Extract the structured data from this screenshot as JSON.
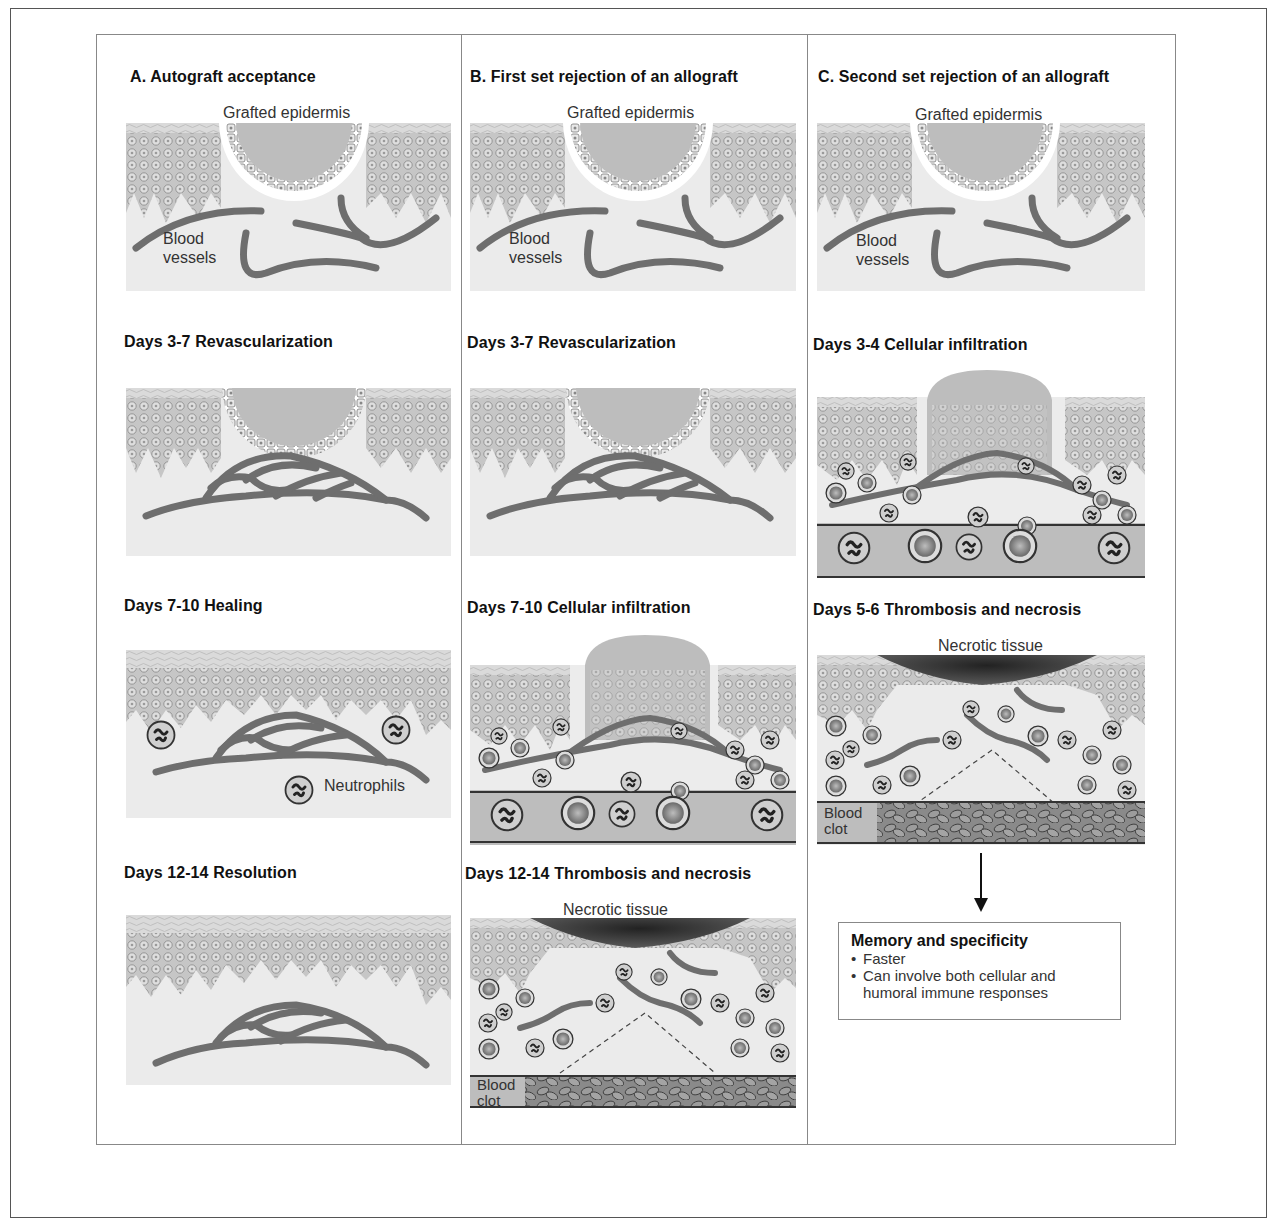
{
  "columns": [
    {
      "heading": "A.  Autograft acceptance",
      "stages": [
        {
          "heading": "",
          "type": "graft",
          "labels": {
            "graft": "Grafted epidermis",
            "vessels_1": "Blood",
            "vessels_2": "vessels"
          }
        },
        {
          "heading": "Days 3-7 Revascularization",
          "type": "revascularization"
        },
        {
          "heading": "Days 7-10 Healing",
          "type": "healing",
          "labels": {
            "neutrophils": "Neutrophils"
          }
        },
        {
          "heading": "Days 12-14 Resolution",
          "type": "resolution"
        }
      ]
    },
    {
      "heading": "B.  First set rejection of an allograft",
      "stages": [
        {
          "heading": "",
          "type": "graft",
          "labels": {
            "graft": "Grafted epidermis",
            "vessels_1": "Blood",
            "vessels_2": "vessels"
          }
        },
        {
          "heading": "Days 3-7 Revascularization",
          "type": "revascularization"
        },
        {
          "heading": "Days 7-10 Cellular infiltration",
          "type": "infiltration"
        },
        {
          "heading": "Days 12-14 Thrombosis and necrosis",
          "type": "necrosis",
          "labels": {
            "necrotic": "Necrotic tissue",
            "clot_1": "Blood",
            "clot_2": "clot"
          }
        }
      ]
    },
    {
      "heading": "C.  Second set rejection of an allograft",
      "stages": [
        {
          "heading": "",
          "type": "graft",
          "labels": {
            "graft": "Grafted epidermis",
            "vessels_1": "Blood",
            "vessels_2": "vessels"
          }
        },
        {
          "heading": "Days 3-4 Cellular infiltration",
          "type": "infiltration"
        },
        {
          "heading": "Days 5-6 Thrombosis and necrosis",
          "type": "necrosis",
          "labels": {
            "necrotic": "Necrotic tissue",
            "clot_1": "Blood",
            "clot_2": "clot"
          }
        }
      ]
    }
  ],
  "memory_box": {
    "title": "Memory and specificity",
    "bullet": "•",
    "items": [
      "Faster",
      "Can involve both cellular and",
      "humoral immune responses"
    ]
  },
  "colors": {
    "dermis": "#ebebeb",
    "epidermis": "#c9c9c9",
    "stratum": "#d8d8d8",
    "vessel": "#6e6e6e",
    "necrotic": "#3a3a3a",
    "line": "#888888"
  }
}
